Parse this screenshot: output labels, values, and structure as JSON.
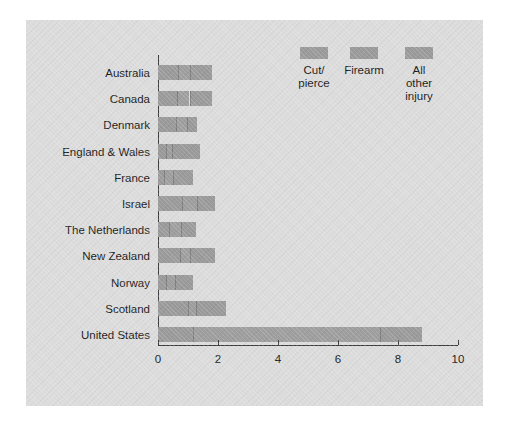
{
  "figure": {
    "background_color": "#dcdcdc",
    "page_color": "#ffffff",
    "bar_color": "#9a9a9a",
    "axis_color": "#3c3c3c"
  },
  "legend": {
    "items": [
      {
        "name": "cut-pierce",
        "label": "Cut/\npierce"
      },
      {
        "name": "firearm",
        "label": "Firearm"
      },
      {
        "name": "all-other-injury",
        "label": "All\nother\ninjury"
      }
    ]
  },
  "axis": {
    "x_ticks": [
      "0",
      "2",
      "4",
      "6",
      "8",
      "10"
    ]
  },
  "categories": [
    "Australia",
    "Canada",
    "Denmark",
    "England & Wales",
    "France",
    "Israel",
    "The Netherlands",
    "New Zealand",
    "Norway",
    "Scotland",
    "United States"
  ],
  "chart_data": {
    "type": "bar",
    "orientation": "horizontal",
    "stacked": true,
    "title": "",
    "xlabel": "",
    "ylabel": "",
    "xlim": [
      0,
      10
    ],
    "xticks": [
      0,
      2,
      4,
      6,
      8,
      10
    ],
    "grid": false,
    "legend_position": "top-right",
    "categories": [
      "Australia",
      "Canada",
      "Denmark",
      "England & Wales",
      "France",
      "Israel",
      "The Netherlands",
      "New Zealand",
      "Norway",
      "Scotland",
      "United States"
    ],
    "series": [
      {
        "name": "Cut/pierce",
        "values": [
          0.65,
          0.63,
          0.6,
          0.25,
          0.2,
          0.8,
          0.35,
          0.73,
          0.25,
          1.0,
          1.15
        ]
      },
      {
        "name": "Firearm",
        "values": [
          0.4,
          0.42,
          0.35,
          0.2,
          0.3,
          0.5,
          0.4,
          0.34,
          0.3,
          0.25,
          6.25
        ]
      },
      {
        "name": "All other injury",
        "values": [
          0.75,
          0.75,
          0.35,
          0.95,
          0.65,
          0.6,
          0.5,
          0.83,
          0.6,
          1.0,
          1.4
        ]
      }
    ],
    "totals": [
      1.8,
      1.8,
      1.3,
      1.4,
      1.15,
      1.9,
      1.25,
      1.9,
      1.15,
      2.25,
      8.8
    ]
  }
}
